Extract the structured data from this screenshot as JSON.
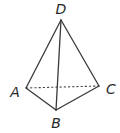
{
  "diagram": {
    "type": "tetrahedron",
    "vertices": [
      {
        "id": "D",
        "label": "D",
        "x": 61,
        "y": 20,
        "label_x": 61,
        "label_y": 14
      },
      {
        "id": "A",
        "label": "A",
        "x": 26,
        "y": 88,
        "label_x": 15,
        "label_y": 97
      },
      {
        "id": "B",
        "label": "B",
        "x": 56,
        "y": 110,
        "label_x": 56,
        "label_y": 128
      },
      {
        "id": "C",
        "label": "C",
        "x": 99,
        "y": 86,
        "label_x": 111,
        "label_y": 94
      }
    ],
    "edges": [
      {
        "from": "D",
        "to": "A",
        "style": "solid"
      },
      {
        "from": "D",
        "to": "B",
        "style": "solid"
      },
      {
        "from": "D",
        "to": "C",
        "style": "solid"
      },
      {
        "from": "A",
        "to": "B",
        "style": "solid"
      },
      {
        "from": "B",
        "to": "C",
        "style": "solid"
      },
      {
        "from": "A",
        "to": "C",
        "style": "dashed"
      }
    ],
    "labels": {
      "D": "D",
      "A": "A",
      "B": "B",
      "C": "C"
    }
  }
}
